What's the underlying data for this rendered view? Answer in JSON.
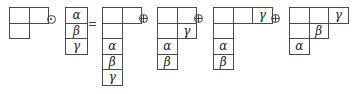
{
  "diagram": {
    "operators": {
      "odot": "⊙",
      "equals": "=",
      "oplus": "⊕"
    },
    "cell_size": {
      "w": 19.5,
      "h": 15.5
    },
    "shapes": [
      {
        "id": "shape-a",
        "origin": [
          9,
          7
        ],
        "cells": [
          {
            "r": 0,
            "c": 0,
            "label": ""
          },
          {
            "r": 0,
            "c": 1,
            "label": ""
          },
          {
            "r": 1,
            "c": 0,
            "label": ""
          }
        ]
      },
      {
        "id": "shape-b",
        "origin": [
          65,
          7
        ],
        "cell_w": 22,
        "cells": [
          {
            "r": 0,
            "c": 0,
            "label": "α"
          },
          {
            "r": 1,
            "c": 0,
            "label": "β"
          },
          {
            "r": 2,
            "c": 0,
            "label": "γ"
          }
        ]
      },
      {
        "id": "result-1",
        "origin": [
          102,
          7
        ],
        "cells": [
          {
            "r": 0,
            "c": 0,
            "label": ""
          },
          {
            "r": 0,
            "c": 1,
            "label": ""
          },
          {
            "r": 1,
            "c": 0,
            "label": ""
          },
          {
            "r": 2,
            "c": 0,
            "label": "α"
          },
          {
            "r": 3,
            "c": 0,
            "label": "β"
          },
          {
            "r": 4,
            "c": 0,
            "label": "γ"
          }
        ]
      },
      {
        "id": "result-2",
        "origin": [
          157,
          7
        ],
        "cells": [
          {
            "r": 0,
            "c": 0,
            "label": ""
          },
          {
            "r": 0,
            "c": 1,
            "label": ""
          },
          {
            "r": 1,
            "c": 0,
            "label": ""
          },
          {
            "r": 1,
            "c": 1,
            "label": "γ"
          },
          {
            "r": 2,
            "c": 0,
            "label": "α"
          },
          {
            "r": 3,
            "c": 0,
            "label": "β"
          }
        ]
      },
      {
        "id": "result-3",
        "origin": [
          213,
          7
        ],
        "cells": [
          {
            "r": 0,
            "c": 0,
            "label": ""
          },
          {
            "r": 0,
            "c": 1,
            "label": ""
          },
          {
            "r": 0,
            "c": 2,
            "label": "γ"
          },
          {
            "r": 1,
            "c": 0,
            "label": ""
          },
          {
            "r": 2,
            "c": 0,
            "label": "α"
          },
          {
            "r": 3,
            "c": 0,
            "label": "β"
          }
        ]
      },
      {
        "id": "result-4",
        "origin": [
          289,
          7
        ],
        "cells": [
          {
            "r": 0,
            "c": 0,
            "label": ""
          },
          {
            "r": 0,
            "c": 1,
            "label": ""
          },
          {
            "r": 0,
            "c": 2,
            "label": "γ"
          },
          {
            "r": 1,
            "c": 0,
            "label": ""
          },
          {
            "r": 1,
            "c": 1,
            "label": "β"
          },
          {
            "r": 2,
            "c": 0,
            "label": "α"
          }
        ]
      }
    ],
    "operator_positions": [
      {
        "type": "odot",
        "x": 51,
        "y": 19
      },
      {
        "type": "equals",
        "x": 89,
        "y": 22
      },
      {
        "type": "oplus",
        "x": 143,
        "y": 18
      },
      {
        "type": "oplus",
        "x": 198,
        "y": 18
      },
      {
        "type": "oplus",
        "x": 275,
        "y": 18
      }
    ]
  }
}
